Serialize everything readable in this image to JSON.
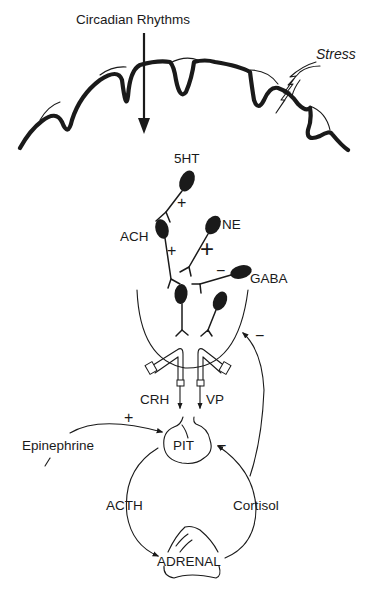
{
  "diagram": {
    "type": "neuroendocrine pathway (HPA axis)",
    "inputs": {
      "circadian_label": "Circadian Rhythms",
      "stress_label": "Stress"
    },
    "neurotransmitters": {
      "serotonin": {
        "label": "5HT",
        "sign": "+"
      },
      "acetylcholine": {
        "label": "ACH",
        "sign": "+"
      },
      "norepinephrine": {
        "label": "NE",
        "sign": "+"
      },
      "gaba": {
        "label": "GABA",
        "sign": "−"
      }
    },
    "hormones": {
      "crh": "CRH",
      "vp": "VP",
      "acth": "ACTH",
      "cortisol": "Cortisol",
      "epinephrine": "Epinephrine"
    },
    "organs": {
      "pituitary": "PIT",
      "adrenal": "ADRENAL"
    },
    "feedback": {
      "epinephrine_to_pit_sign": "+",
      "cortisol_to_pit_sign": "−",
      "cortisol_to_hypothalamus_sign": "−"
    },
    "colors": {
      "ink": "#1a1a1a",
      "background": "#ffffff"
    }
  }
}
